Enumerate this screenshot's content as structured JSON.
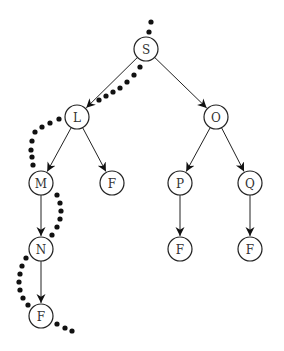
{
  "diagram": {
    "type": "search-tree",
    "node_radius": 12,
    "nodes": [
      {
        "id": "S",
        "label": "S",
        "x": 146,
        "y": 49
      },
      {
        "id": "L",
        "label": "L",
        "x": 77,
        "y": 117
      },
      {
        "id": "O",
        "label": "O",
        "x": 216,
        "y": 117
      },
      {
        "id": "M",
        "label": "M",
        "x": 41,
        "y": 183
      },
      {
        "id": "F1",
        "label": "F",
        "x": 112,
        "y": 183
      },
      {
        "id": "P",
        "label": "P",
        "x": 180,
        "y": 183
      },
      {
        "id": "Q",
        "label": "Q",
        "x": 250,
        "y": 183
      },
      {
        "id": "N",
        "label": "N",
        "x": 41,
        "y": 249
      },
      {
        "id": "F2",
        "label": "F",
        "x": 180,
        "y": 249
      },
      {
        "id": "F3",
        "label": "F",
        "x": 250,
        "y": 249
      },
      {
        "id": "F4",
        "label": "F",
        "x": 41,
        "y": 316
      }
    ],
    "edges": [
      [
        "S",
        "L"
      ],
      [
        "S",
        "O"
      ],
      [
        "L",
        "M"
      ],
      [
        "L",
        "F1"
      ],
      [
        "O",
        "P"
      ],
      [
        "O",
        "Q"
      ],
      [
        "M",
        "N"
      ],
      [
        "P",
        "F2"
      ],
      [
        "Q",
        "F3"
      ],
      [
        "N",
        "F4"
      ]
    ],
    "traversal_path": [
      "S",
      "L",
      "M",
      "N",
      "F4"
    ],
    "traversal_dots": [
      [
        151,
        22
      ],
      [
        149,
        32
      ],
      [
        140,
        67
      ],
      [
        134,
        75
      ],
      [
        127,
        82
      ],
      [
        120,
        88
      ],
      [
        113,
        92
      ],
      [
        106,
        96
      ],
      [
        99,
        100
      ],
      [
        59,
        119
      ],
      [
        50,
        123
      ],
      [
        42,
        127
      ],
      [
        35,
        132
      ],
      [
        32,
        141
      ],
      [
        31,
        150
      ],
      [
        32,
        157
      ],
      [
        33,
        165
      ],
      [
        57,
        195
      ],
      [
        60,
        203
      ],
      [
        61,
        211
      ],
      [
        60,
        219
      ],
      [
        57,
        227
      ],
      [
        52,
        235
      ],
      [
        26,
        258
      ],
      [
        22,
        266
      ],
      [
        20,
        274
      ],
      [
        19,
        282
      ],
      [
        20,
        290
      ],
      [
        23,
        298
      ],
      [
        28,
        305
      ],
      [
        57,
        324
      ],
      [
        65,
        328
      ],
      [
        72,
        331
      ]
    ],
    "colors": {
      "stroke": "#222222",
      "dots": "#111111",
      "fill": "#ffffff"
    }
  }
}
